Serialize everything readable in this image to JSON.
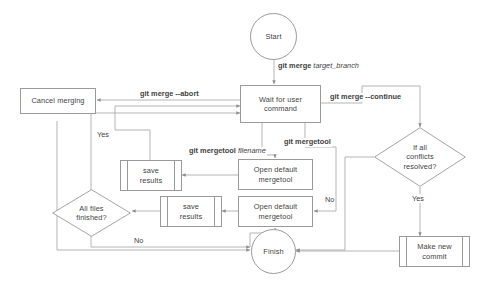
{
  "diagram": {
    "type": "flowchart",
    "stroke_color": "#9a9a9a",
    "text_color": "#3f3f3f",
    "background": "#ffffff"
  },
  "nodes": {
    "start": {
      "label": "Start",
      "shape": "terminator"
    },
    "cancel_merging": {
      "label": "Cancel merging",
      "shape": "process"
    },
    "wait_for_user": {
      "label": "Wait for user command",
      "line1": "Wait for user",
      "line2": "command",
      "shape": "process"
    },
    "save_results_top": {
      "label": "save results",
      "line1": "save",
      "line2": "results",
      "shape": "predefined-process"
    },
    "save_results_bottom": {
      "label": "save results",
      "line1": "save",
      "line2": "results",
      "shape": "predefined-process"
    },
    "open_mergetool_top": {
      "label": "Open default mergetool",
      "line1": "Open default",
      "line2": "mergetool",
      "shape": "process"
    },
    "open_mergetool_bottom": {
      "label": "Open default mergetool",
      "line1": "Open default",
      "line2": "mergetool",
      "shape": "process"
    },
    "all_files_finished": {
      "label": "All files finished?",
      "line1": "All files",
      "line2": "finished?",
      "shape": "decision"
    },
    "if_all_conflicts": {
      "label": "If all conflicts resolved?",
      "line1": "If all",
      "line2": "conflicts",
      "line3": "resolved?",
      "shape": "decision"
    },
    "finish": {
      "label": "Finish",
      "shape": "terminator"
    },
    "make_new_commit": {
      "label": "Make new commit",
      "line1": "Make new",
      "line2": "commit",
      "shape": "predefined-process"
    }
  },
  "edge_labels": {
    "git_merge_target_branch_cmd": "git merge ",
    "git_merge_target_branch_arg": "target_branch",
    "git_merge_abort": "git merge --abort",
    "git_merge_continue": "git merge --continue",
    "git_mergetool": "git mergetool",
    "git_mergetool_filename_cmd": "git mergetool ",
    "git_mergetool_filename_arg": "filename",
    "yes_left": "Yes",
    "yes_right": "Yes",
    "no_right": "No",
    "no_bottom": "No"
  }
}
